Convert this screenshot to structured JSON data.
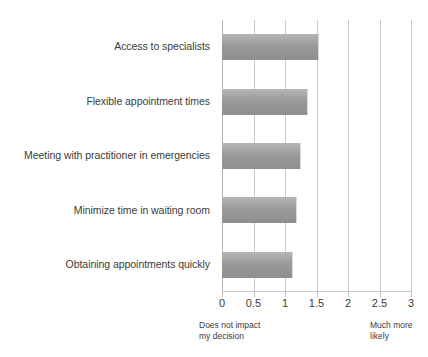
{
  "chart_data": {
    "type": "bar",
    "orientation": "horizontal",
    "title": "",
    "subtitle": "",
    "xlabel": "",
    "ylabel": "",
    "categories": [
      "Access to specialists",
      "Flexible appointment times",
      "Meeting with practitioner in emergencies",
      "Minimize time in waiting room",
      "Obtaining appointments quickly"
    ],
    "values": [
      1.54,
      1.37,
      1.25,
      1.19,
      1.13
    ],
    "series": [
      {
        "name": "",
        "values": [
          1.54,
          1.37,
          1.25,
          1.19,
          1.13
        ]
      }
    ],
    "xlim": [
      0,
      3
    ],
    "ylim": null,
    "xticks": [
      0,
      0.5,
      1,
      1.5,
      2,
      2.5,
      3
    ],
    "xtick_labels": [
      "0",
      "0.5",
      "1",
      "1.5",
      "2",
      "2.5",
      "3"
    ],
    "grid": true,
    "grid_axis": "x",
    "legend": false,
    "legend_position": "none",
    "bar_color": "#9a9a9a",
    "gridline_color": "#c9c9c9",
    "text_color": "#3b3b3b",
    "annotations": [
      {
        "text": "Does not impact\nmy decision",
        "anchor_value": 0,
        "position": "below-left"
      },
      {
        "text": "Much more\nlikely",
        "anchor_value": 3,
        "position": "below-right"
      }
    ]
  },
  "axis": {
    "scale_low_label": "Does not impact\nmy decision",
    "scale_high_label": "Much more\nlikely"
  }
}
